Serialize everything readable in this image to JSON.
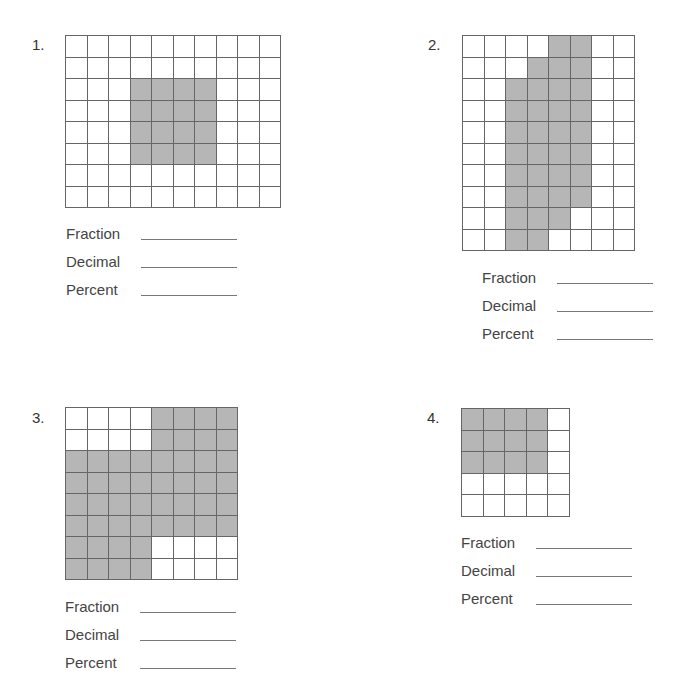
{
  "worksheet": {
    "answer_labels": [
      "Fraction",
      "Decimal",
      "Percent"
    ],
    "shade_color": "#b6b6b6",
    "problems": [
      {
        "number": "1.",
        "cols": 10,
        "rows": 8,
        "shaded": [
          [
            2,
            3
          ],
          [
            2,
            4
          ],
          [
            2,
            5
          ],
          [
            2,
            6
          ],
          [
            3,
            3
          ],
          [
            3,
            4
          ],
          [
            3,
            5
          ],
          [
            3,
            6
          ],
          [
            4,
            3
          ],
          [
            4,
            4
          ],
          [
            4,
            5
          ],
          [
            4,
            6
          ],
          [
            5,
            3
          ],
          [
            5,
            4
          ],
          [
            5,
            5
          ],
          [
            5,
            6
          ]
        ],
        "answers": {
          "fraction": "",
          "decimal": "",
          "percent": ""
        }
      },
      {
        "number": "2.",
        "cols": 8,
        "rows": 10,
        "shaded": [
          [
            0,
            4
          ],
          [
            0,
            5
          ],
          [
            1,
            3
          ],
          [
            1,
            4
          ],
          [
            1,
            5
          ],
          [
            2,
            2
          ],
          [
            2,
            3
          ],
          [
            2,
            4
          ],
          [
            2,
            5
          ],
          [
            3,
            2
          ],
          [
            3,
            3
          ],
          [
            3,
            4
          ],
          [
            3,
            5
          ],
          [
            4,
            2
          ],
          [
            4,
            3
          ],
          [
            4,
            4
          ],
          [
            4,
            5
          ],
          [
            5,
            2
          ],
          [
            5,
            3
          ],
          [
            5,
            4
          ],
          [
            5,
            5
          ],
          [
            6,
            2
          ],
          [
            6,
            3
          ],
          [
            6,
            4
          ],
          [
            6,
            5
          ],
          [
            7,
            2
          ],
          [
            7,
            3
          ],
          [
            7,
            4
          ],
          [
            7,
            5
          ],
          [
            8,
            2
          ],
          [
            8,
            3
          ],
          [
            8,
            4
          ],
          [
            9,
            2
          ],
          [
            9,
            3
          ]
        ],
        "answers": {
          "fraction": "",
          "decimal": "",
          "percent": ""
        }
      },
      {
        "number": "3.",
        "cols": 8,
        "rows": 8,
        "shaded": [
          [
            0,
            4
          ],
          [
            0,
            5
          ],
          [
            0,
            6
          ],
          [
            0,
            7
          ],
          [
            1,
            4
          ],
          [
            1,
            5
          ],
          [
            1,
            6
          ],
          [
            1,
            7
          ],
          [
            2,
            0
          ],
          [
            2,
            1
          ],
          [
            2,
            2
          ],
          [
            2,
            3
          ],
          [
            2,
            4
          ],
          [
            2,
            5
          ],
          [
            2,
            6
          ],
          [
            2,
            7
          ],
          [
            3,
            0
          ],
          [
            3,
            1
          ],
          [
            3,
            2
          ],
          [
            3,
            3
          ],
          [
            3,
            4
          ],
          [
            3,
            5
          ],
          [
            3,
            6
          ],
          [
            3,
            7
          ],
          [
            4,
            0
          ],
          [
            4,
            1
          ],
          [
            4,
            2
          ],
          [
            4,
            3
          ],
          [
            4,
            4
          ],
          [
            4,
            5
          ],
          [
            4,
            6
          ],
          [
            4,
            7
          ],
          [
            5,
            0
          ],
          [
            5,
            1
          ],
          [
            5,
            2
          ],
          [
            5,
            3
          ],
          [
            5,
            4
          ],
          [
            5,
            5
          ],
          [
            5,
            6
          ],
          [
            5,
            7
          ],
          [
            6,
            0
          ],
          [
            6,
            1
          ],
          [
            6,
            2
          ],
          [
            6,
            3
          ],
          [
            7,
            0
          ],
          [
            7,
            1
          ],
          [
            7,
            2
          ],
          [
            7,
            3
          ]
        ],
        "answers": {
          "fraction": "",
          "decimal": "",
          "percent": ""
        }
      },
      {
        "number": "4.",
        "cols": 5,
        "rows": 5,
        "shaded": [
          [
            0,
            0
          ],
          [
            0,
            1
          ],
          [
            0,
            2
          ],
          [
            0,
            3
          ],
          [
            1,
            0
          ],
          [
            1,
            1
          ],
          [
            1,
            2
          ],
          [
            1,
            3
          ],
          [
            2,
            0
          ],
          [
            2,
            1
          ],
          [
            2,
            2
          ],
          [
            2,
            3
          ]
        ],
        "answers": {
          "fraction": "",
          "decimal": "",
          "percent": ""
        }
      }
    ]
  }
}
